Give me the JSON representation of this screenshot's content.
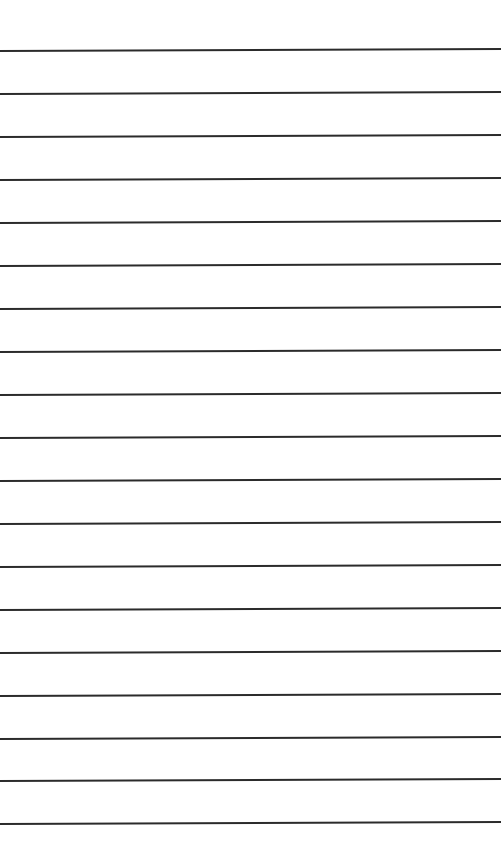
{
  "page": {
    "type": "lined-paper",
    "background_color": "#ffffff",
    "line_color": "#2b2b2b",
    "line_count": 19,
    "first_line_y": 51,
    "line_spacing": 43
  },
  "lines": [
    {
      "y": 51
    },
    {
      "y": 94
    },
    {
      "y": 137
    },
    {
      "y": 180
    },
    {
      "y": 223
    },
    {
      "y": 266
    },
    {
      "y": 309
    },
    {
      "y": 352
    },
    {
      "y": 395
    },
    {
      "y": 438
    },
    {
      "y": 481
    },
    {
      "y": 524
    },
    {
      "y": 567
    },
    {
      "y": 610
    },
    {
      "y": 653
    },
    {
      "y": 696
    },
    {
      "y": 739
    },
    {
      "y": 781
    },
    {
      "y": 824
    }
  ]
}
